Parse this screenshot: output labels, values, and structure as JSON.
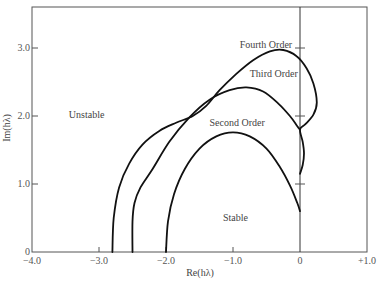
{
  "chart_data": {
    "type": "line",
    "title": "",
    "xlabel": "Re(hλ)",
    "ylabel": "Im(hλ)",
    "xlim": [
      -4.0,
      1.0
    ],
    "ylim": [
      0,
      3.5
    ],
    "grid": false,
    "x_ticks": [
      {
        "value": -4.0,
        "label": "−4.0"
      },
      {
        "value": -3.0,
        "label": "−3.0"
      },
      {
        "value": -2.0,
        "label": "−2.0"
      },
      {
        "value": -1.0,
        "label": "−1.0"
      },
      {
        "value": 0,
        "label": "0"
      },
      {
        "value": 1.0,
        "label": "+1.0"
      }
    ],
    "y_ticks": [
      {
        "value": 0,
        "label": "0"
      },
      {
        "value": 1.0,
        "label": "1.0"
      },
      {
        "value": 2.0,
        "label": "2.0"
      },
      {
        "value": 3.0,
        "label": "3.0"
      }
    ],
    "series": [
      {
        "name": "Second Order",
        "x": [
          -2.0,
          -1.97,
          -1.88,
          -1.72,
          -1.5,
          -1.25,
          -1.0,
          -0.75,
          -0.5,
          -0.3,
          -0.15,
          -0.04,
          0.0
        ],
        "y": [
          0.0,
          0.45,
          0.85,
          1.22,
          1.52,
          1.7,
          1.76,
          1.7,
          1.52,
          1.25,
          0.98,
          0.72,
          0.6
        ]
      },
      {
        "name": "Third Order",
        "x": [
          -2.5,
          -2.5,
          -2.47,
          -2.38,
          -2.2,
          -1.95,
          -1.65,
          -1.35,
          -1.05,
          -0.8,
          -0.55,
          -0.32,
          -0.15,
          -0.04,
          0.0
        ],
        "y": [
          0.0,
          0.45,
          0.72,
          0.95,
          1.22,
          1.62,
          1.98,
          2.24,
          2.38,
          2.42,
          2.36,
          2.18,
          2.0,
          1.85,
          1.8
        ]
      },
      {
        "name": "Fourth Order",
        "x": [
          -2.8,
          -2.78,
          -2.7,
          -2.55,
          -2.35,
          -2.1,
          -1.85,
          -1.6,
          -1.4,
          -1.2,
          -0.95,
          -0.7,
          -0.45,
          -0.25,
          -0.05,
          0.1,
          0.2,
          0.25,
          0.2,
          0.08,
          0.0,
          0.04,
          0.06,
          0.04,
          0.0
        ],
        "y": [
          0.0,
          0.5,
          0.95,
          1.3,
          1.58,
          1.78,
          1.9,
          2.0,
          2.15,
          2.38,
          2.62,
          2.82,
          2.95,
          2.97,
          2.88,
          2.7,
          2.48,
          2.2,
          2.02,
          1.88,
          1.8,
          1.62,
          1.45,
          1.28,
          1.15
        ]
      }
    ],
    "annotations": [
      {
        "text": "Fourth Order",
        "x": -0.9,
        "y": 3.0
      },
      {
        "text": "Third Order",
        "x": -0.75,
        "y": 2.57
      },
      {
        "text": "Second Order",
        "x": -1.35,
        "y": 1.85
      },
      {
        "text": "Unstable",
        "x": -3.45,
        "y": 1.97
      },
      {
        "text": "Stable",
        "x": -1.15,
        "y": 0.45
      }
    ]
  }
}
